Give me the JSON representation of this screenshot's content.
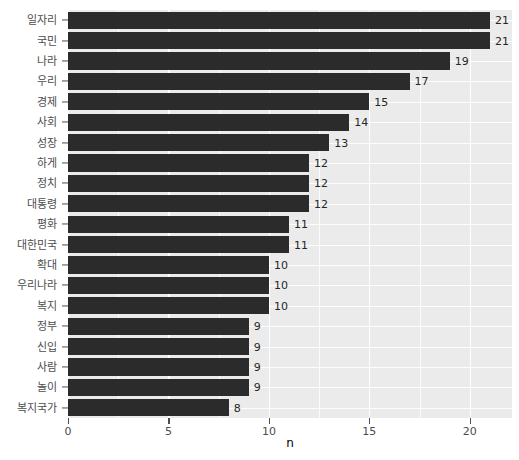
{
  "chart_data": {
    "type": "bar",
    "orientation": "horizontal",
    "title": "",
    "subtitle": "",
    "xlabel": "n",
    "ylabel": "",
    "xlim": [
      0,
      22.1
    ],
    "ylim": null,
    "grid": true,
    "legend": null,
    "legend_position": "none",
    "x_ticks": [
      0,
      5,
      10,
      15,
      20
    ],
    "x_tick_labels": [
      "0",
      "5",
      "10",
      "15",
      "20"
    ],
    "x_minor_ticks": [
      2.5,
      7.5,
      12.5,
      17.5
    ],
    "categories": [
      "일자리",
      "국민",
      "나라",
      "우리",
      "경제",
      "사회",
      "성장",
      "하게",
      "정치",
      "대통령",
      "평화",
      "대한민국",
      "확대",
      "우리나라",
      "복지",
      "정부",
      "신입",
      "사람",
      "놀이",
      "복지국가"
    ],
    "values": [
      21,
      21,
      19,
      17,
      15,
      14,
      13,
      12,
      12,
      12,
      11,
      11,
      10,
      10,
      10,
      9,
      9,
      9,
      9,
      8
    ],
    "value_labels": [
      "21",
      "21",
      "19",
      "17",
      "15",
      "14",
      "13",
      "12",
      "12",
      "12",
      "11",
      "11",
      "10",
      "10",
      "10",
      "9",
      "9",
      "9",
      "9",
      "8"
    ],
    "colors": {
      "bar": "#2B2B2B",
      "panel_background": "#EBEBEB",
      "gridline": "#FFFFFF",
      "plot_background": "#FFFFFF",
      "axis_text": "#4D4D4D",
      "value_label_text": "#262626",
      "axis_title": "#000000"
    }
  }
}
